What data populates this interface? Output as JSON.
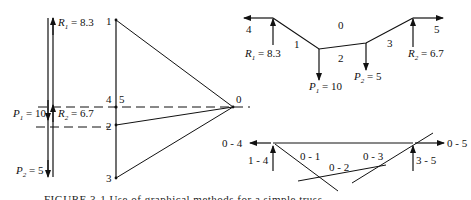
{
  "force_polygon": {
    "loads": {
      "R1": "8.3",
      "R2": "6.7",
      "P1": "10",
      "P2": "5"
    },
    "labels": {
      "R1": "R",
      "R1_sub": "1",
      "R1_val": " = 8.3",
      "R2": "R",
      "R2_sub": "2",
      "R2_val": " = 6.7",
      "P1": "P",
      "P1_sub": "1",
      "P1_val": " = 10",
      "P2": "P",
      "P2_sub": "2",
      "P2_val": " = 5"
    },
    "points": {
      "p1": "1",
      "p4": "4",
      "p5": "5",
      "p2": "2",
      "p3": "3",
      "p0": "0"
    }
  },
  "funicular_polygon": {
    "labels": {
      "left_force": "4",
      "right_force": "5",
      "space0": "0",
      "seg1": "1",
      "seg2": "2",
      "seg3": "3",
      "R1": "R",
      "R1_sub": "1",
      "R1_val": " = 8.3",
      "R2": "R",
      "R2_sub": "2",
      "R2_val": " = 6.7",
      "P1": "P",
      "P1_sub": "1",
      "P1_val": " = 10",
      "P2": "P",
      "P2_sub": "2",
      "P2_val": " = 5"
    }
  },
  "member_diagram": {
    "labels": {
      "m04": "0 - 4",
      "m05": "0 - 5",
      "m14": "1 - 4",
      "m35": "3 - 5",
      "m01": "0 - 1",
      "m02": "0 - 2",
      "m03": "0 - 3"
    }
  },
  "caption": "FIGURE 3-1  Use of graphical methods for a simple truss"
}
